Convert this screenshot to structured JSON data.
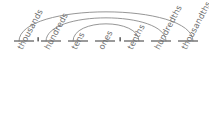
{
  "diagram": {
    "type": "place-value-chart",
    "title": "",
    "baseline_y": 41,
    "decimal_point_label": ".",
    "slots": [
      {
        "id": "thousands",
        "label": "thousands",
        "dash_x1": 14,
        "dash_x2": 34,
        "label_x": 16,
        "label_y": 47
      },
      {
        "id": "hundreds",
        "label": "hundreds",
        "dash_x1": 41,
        "dash_x2": 61,
        "label_x": 43,
        "label_y": 47
      },
      {
        "id": "tens",
        "label": "tens",
        "dash_x1": 68,
        "dash_x2": 88,
        "label_x": 70,
        "label_y": 47
      },
      {
        "id": "ones",
        "label": "ones",
        "dash_x1": 95,
        "dash_x2": 115,
        "label_x": 97,
        "label_y": 47
      },
      {
        "id": "tenths",
        "label": "tenths",
        "dash_x1": 124,
        "dash_x2": 144,
        "label_x": 126,
        "label_y": 47
      },
      {
        "id": "hundredths",
        "label": "hundredths",
        "dash_x1": 151,
        "dash_x2": 171,
        "label_x": 153,
        "label_y": 47
      },
      {
        "id": "thousandths",
        "label": "thousandths",
        "dash_x1": 178,
        "dash_x2": 198,
        "label_x": 180,
        "label_y": 47
      }
    ],
    "decimal_points": [
      {
        "id": "dot-left",
        "x": 38,
        "y": 40
      },
      {
        "id": "dot-right",
        "x": 120,
        "y": 40
      }
    ],
    "arcs": [
      {
        "id": "arc-thousands-thousandths",
        "pairs": "thousands-thousandths",
        "x1": 19,
        "x2": 193,
        "apex_y": 8
      },
      {
        "id": "arc-hundreds-hundredths",
        "pairs": "hundreds-hundredths",
        "x1": 46,
        "x2": 166,
        "apex_y": 16
      },
      {
        "id": "arc-tens-tenths",
        "pairs": "tens-tenths",
        "x1": 73,
        "x2": 139,
        "apex_y": 24
      }
    ],
    "colors": {
      "line": "#8a8a8a",
      "dash": "#6f6f6f",
      "label": "#6e6e6e",
      "background": "#ffffff"
    }
  }
}
